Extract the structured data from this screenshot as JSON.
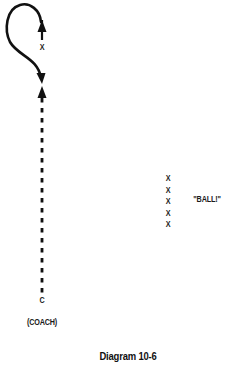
{
  "diagram": {
    "caption": "Diagram 10-6",
    "coach": {
      "symbol": "C",
      "label": "(COACH)"
    },
    "runner": {
      "symbol": "X"
    },
    "line_players": {
      "symbols": [
        "X",
        "X",
        "X",
        "X",
        "X"
      ]
    },
    "callout": "\"BALL!\"",
    "colors": {
      "ink": "#111111",
      "background": "#ffffff"
    },
    "elements": [
      {
        "type": "curved-arrow",
        "description": "loop route from top-left curving down to arrowhead pointing down"
      },
      {
        "type": "solid-arrow",
        "description": "short upward arrow above runner X"
      },
      {
        "type": "dashed-arrow",
        "description": "vertical dashed line from coach upward to arrowhead"
      }
    ]
  }
}
